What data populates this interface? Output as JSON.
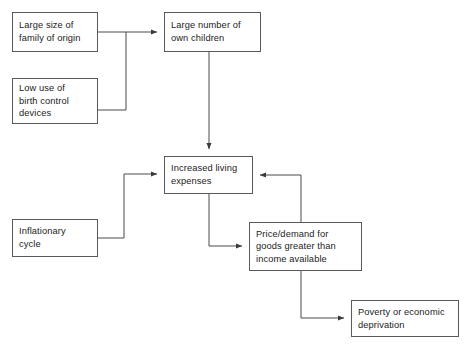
{
  "diagram": {
    "type": "flowchart",
    "canvas": {
      "width": 467,
      "height": 348,
      "background": "#ffffff"
    },
    "style": {
      "box_border_color": "#5a5a5a",
      "box_fill": "#ffffff",
      "text_color": "#1c1c1c",
      "edge_color": "#4a4a4a"
    },
    "nodes": [
      {
        "id": "large-family-size",
        "label": "Large size of\nfamily of origin",
        "x": 12,
        "y": 12,
        "w": 86,
        "h": 40
      },
      {
        "id": "low-birth-control",
        "label": "Low use of\nbirth control\ndevices",
        "x": 12,
        "y": 78,
        "w": 86,
        "h": 46
      },
      {
        "id": "many-own-children",
        "label": "Large number of\nown children",
        "x": 164,
        "y": 12,
        "w": 97,
        "h": 40
      },
      {
        "id": "increased-living-expenses",
        "label": "Increased living\nexpenses",
        "x": 164,
        "y": 156,
        "w": 89,
        "h": 38
      },
      {
        "id": "inflationary-cycle",
        "label": "Inflationary\ncycle",
        "x": 12,
        "y": 219,
        "w": 86,
        "h": 38
      },
      {
        "id": "price-demand-exceeds-income",
        "label": "Price/demand for\ngoods greater than\nincome available",
        "x": 249,
        "y": 222,
        "w": 113,
        "h": 49
      },
      {
        "id": "poverty-or-deprivation",
        "label": "Poverty or economic\ndeprivation",
        "x": 351,
        "y": 300,
        "w": 108,
        "h": 37
      }
    ],
    "edges": [
      {
        "id": "edge-family-size-to-children",
        "from": "large-family-size",
        "to": "many-own-children",
        "arrow": true
      },
      {
        "id": "edge-birth-control-to-children",
        "from": "low-birth-control",
        "to": "many-own-children",
        "arrow": true
      },
      {
        "id": "edge-children-to-expenses",
        "from": "many-own-children",
        "to": "increased-living-expenses",
        "arrow": true
      },
      {
        "id": "edge-inflation-to-expenses",
        "from": "inflationary-cycle",
        "to": "increased-living-expenses",
        "arrow": true
      },
      {
        "id": "edge-expenses-to-price-demand",
        "from": "increased-living-expenses",
        "to": "price-demand-exceeds-income",
        "arrow": true
      },
      {
        "id": "edge-price-demand-to-expenses",
        "from": "price-demand-exceeds-income",
        "to": "increased-living-expenses",
        "arrow": true
      },
      {
        "id": "edge-price-demand-to-poverty",
        "from": "price-demand-exceeds-income",
        "to": "poverty-or-deprivation",
        "arrow": true
      }
    ]
  }
}
